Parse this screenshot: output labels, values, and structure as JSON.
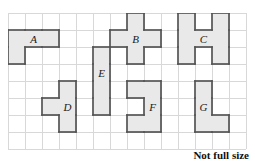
{
  "figure": {
    "caption": "Not full size",
    "colors": {
      "shape_fill": "#e9e9e9",
      "shape_stroke": "#545454",
      "grid_line": "#d8d8d8",
      "background": "#ffffff",
      "label_text": "#1a1a1a"
    },
    "grid": {
      "columns": 14,
      "rows": 8,
      "cell_size": 17,
      "origin_x": 8,
      "origin_y": 13
    },
    "shapes": [
      {
        "id": "A",
        "label": "A",
        "description": "L-shaped pentomino-style piece: three cells across the top row and one cell below the leftmost cell",
        "cells": [
          [
            0,
            1
          ],
          [
            1,
            1
          ],
          [
            2,
            1
          ],
          [
            0,
            2
          ]
        ],
        "label_cell": [
          1,
          1
        ]
      },
      {
        "id": "B",
        "label": "B",
        "description": "Plus / cross shape made of five cells",
        "cells": [
          [
            7,
            0
          ],
          [
            6,
            1
          ],
          [
            7,
            1
          ],
          [
            8,
            1
          ],
          [
            7,
            2
          ]
        ],
        "label_cell": [
          7,
          1
        ]
      },
      {
        "id": "C",
        "label": "C",
        "description": "H shape: two vertical bars of three cells joined by a middle cell",
        "cells": [
          [
            10,
            0
          ],
          [
            12,
            0
          ],
          [
            10,
            1
          ],
          [
            11,
            1
          ],
          [
            12,
            1
          ],
          [
            10,
            2
          ],
          [
            12,
            2
          ]
        ],
        "label_cell": [
          11,
          1
        ]
      },
      {
        "id": "D",
        "label": "D",
        "description": "Vertical bar of three cells with one cell attached to the left of the middle cell",
        "cells": [
          [
            3,
            4
          ],
          [
            2,
            5
          ],
          [
            3,
            5
          ],
          [
            3,
            6
          ]
        ],
        "label_cell": [
          3,
          5
        ]
      },
      {
        "id": "E",
        "label": "E",
        "description": "Vertical rectangle one cell wide and four cells tall",
        "cells": [
          [
            5,
            2
          ],
          [
            5,
            3
          ],
          [
            5,
            4
          ],
          [
            5,
            5
          ]
        ],
        "label_cell": [
          5,
          3
        ]
      },
      {
        "id": "F",
        "label": "F",
        "description": "C shape: two cells wide and three cells tall with the left middle cell removed",
        "cells": [
          [
            7,
            4
          ],
          [
            8,
            4
          ],
          [
            8,
            5
          ],
          [
            7,
            6
          ],
          [
            8,
            6
          ]
        ],
        "label_cell": [
          8,
          5
        ]
      },
      {
        "id": "G",
        "label": "G",
        "description": "L shape: vertical bar of three cells with one cell attached to the right of the bottom cell",
        "cells": [
          [
            11,
            4
          ],
          [
            11,
            5
          ],
          [
            11,
            6
          ],
          [
            12,
            6
          ]
        ],
        "label_cell": [
          11,
          5
        ]
      }
    ]
  }
}
